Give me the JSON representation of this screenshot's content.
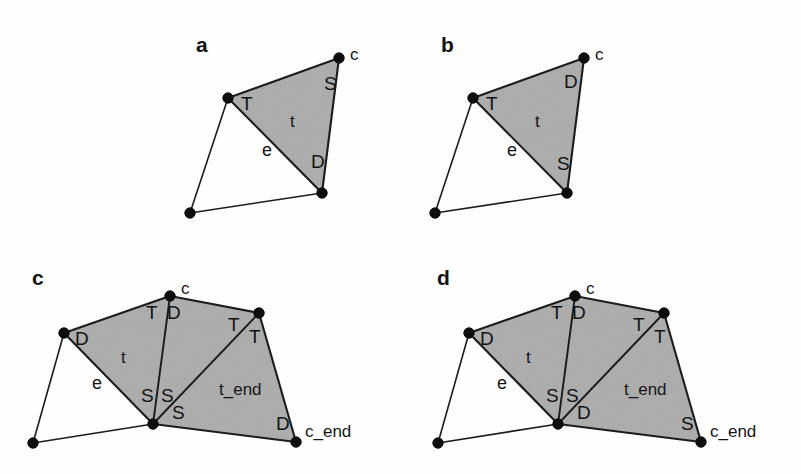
{
  "figure": {
    "background_color": "#fefefe",
    "shade_color": "#ababab",
    "line_color": "#1c1c1c",
    "node_color": "#0d0d0d",
    "panels": [
      {
        "id": "a",
        "letter": "a",
        "letter_pos": [
          196,
          52
        ],
        "shaded_polygon": [
          [
            228,
            98
          ],
          [
            339,
            58
          ],
          [
            322,
            193
          ]
        ],
        "open_polygon": [
          [
            228,
            98
          ],
          [
            190,
            213
          ],
          [
            322,
            193
          ]
        ],
        "nodes": [
          {
            "name": "node-top-right",
            "x": 339,
            "y": 58
          },
          {
            "name": "node-left",
            "x": 228,
            "y": 98
          },
          {
            "name": "node-bottom-right",
            "x": 322,
            "y": 193
          },
          {
            "name": "node-bottom-left",
            "x": 190,
            "y": 213
          }
        ],
        "labels": [
          {
            "name": "vertex-label-c",
            "text": "c",
            "x": 350,
            "y": 60,
            "cls": "vertex-label"
          },
          {
            "name": "half-edge-label-T",
            "text": "T",
            "x": 241,
            "y": 110,
            "cls": "half-edge-label"
          },
          {
            "name": "half-edge-label-S",
            "text": "S",
            "x": 324,
            "y": 90,
            "cls": "half-edge-label"
          },
          {
            "name": "face-label-t",
            "text": "t",
            "x": 290,
            "y": 127,
            "cls": "face-label"
          },
          {
            "name": "edge-label-e",
            "text": "e",
            "x": 262,
            "y": 156,
            "cls": "edge-label"
          },
          {
            "name": "half-edge-label-D",
            "text": "D",
            "x": 311,
            "y": 168,
            "cls": "half-edge-label"
          }
        ]
      },
      {
        "id": "b",
        "letter": "b",
        "letter_pos": [
          441,
          52
        ],
        "shaded_polygon": [
          [
            473,
            98
          ],
          [
            584,
            58
          ],
          [
            567,
            193
          ]
        ],
        "open_polygon": [
          [
            473,
            98
          ],
          [
            435,
            213
          ],
          [
            567,
            193
          ]
        ],
        "nodes": [
          {
            "name": "node-top-right",
            "x": 584,
            "y": 58
          },
          {
            "name": "node-left",
            "x": 473,
            "y": 98
          },
          {
            "name": "node-bottom-right",
            "x": 567,
            "y": 193
          },
          {
            "name": "node-bottom-left",
            "x": 435,
            "y": 213
          }
        ],
        "labels": [
          {
            "name": "vertex-label-c",
            "text": "c",
            "x": 595,
            "y": 60,
            "cls": "vertex-label"
          },
          {
            "name": "half-edge-label-T",
            "text": "T",
            "x": 486,
            "y": 110,
            "cls": "half-edge-label"
          },
          {
            "name": "half-edge-label-D",
            "text": "D",
            "x": 564,
            "y": 88,
            "cls": "half-edge-label"
          },
          {
            "name": "face-label-t",
            "text": "t",
            "x": 535,
            "y": 127,
            "cls": "face-label"
          },
          {
            "name": "edge-label-e",
            "text": "e",
            "x": 507,
            "y": 156,
            "cls": "edge-label"
          },
          {
            "name": "half-edge-label-S",
            "text": "S",
            "x": 557,
            "y": 170,
            "cls": "half-edge-label"
          }
        ]
      },
      {
        "id": "c",
        "letter": "c",
        "letter_pos": [
          32,
          285
        ],
        "shaded_polygon": [
          [
            64,
            333
          ],
          [
            170,
            296
          ],
          [
            259,
            313
          ],
          [
            296,
            442
          ],
          [
            153,
            424
          ]
        ],
        "open_polygon": [
          [
            64,
            333
          ],
          [
            33,
            443
          ],
          [
            153,
            424
          ]
        ],
        "inner_lines": [
          [
            [
              170,
              296
            ],
            [
              153,
              424
            ]
          ],
          [
            [
              259,
              313
            ],
            [
              153,
              424
            ]
          ]
        ],
        "nodes": [
          {
            "name": "node-c",
            "x": 170,
            "y": 296
          },
          {
            "name": "node-left",
            "x": 64,
            "y": 333
          },
          {
            "name": "node-top-right",
            "x": 259,
            "y": 313
          },
          {
            "name": "node-center-bottom",
            "x": 153,
            "y": 424
          },
          {
            "name": "node-c-end",
            "x": 296,
            "y": 442
          },
          {
            "name": "node-bottom-left",
            "x": 33,
            "y": 443
          }
        ],
        "labels": [
          {
            "name": "vertex-label-c",
            "text": "c",
            "x": 181,
            "y": 294,
            "cls": "vertex-label"
          },
          {
            "name": "half-edge-label-T1",
            "text": "T",
            "x": 146,
            "y": 319,
            "cls": "half-edge-label"
          },
          {
            "name": "half-edge-label-D1",
            "text": "D",
            "x": 167,
            "y": 319,
            "cls": "half-edge-label"
          },
          {
            "name": "half-edge-label-T2",
            "text": "T",
            "x": 228,
            "y": 331,
            "cls": "half-edge-label"
          },
          {
            "name": "half-edge-label-T3",
            "text": "T",
            "x": 249,
            "y": 343,
            "cls": "half-edge-label"
          },
          {
            "name": "half-edge-label-D2",
            "text": "D",
            "x": 75,
            "y": 345,
            "cls": "half-edge-label"
          },
          {
            "name": "face-label-t",
            "text": "t",
            "x": 121,
            "y": 363,
            "cls": "face-label"
          },
          {
            "name": "edge-label-e",
            "text": "e",
            "x": 92,
            "y": 389,
            "cls": "edge-label"
          },
          {
            "name": "half-edge-label-S1",
            "text": "S",
            "x": 141,
            "y": 402,
            "cls": "half-edge-label"
          },
          {
            "name": "half-edge-label-S2",
            "text": "S",
            "x": 161,
            "y": 402,
            "cls": "half-edge-label"
          },
          {
            "name": "half-edge-label-S3",
            "text": "S",
            "x": 172,
            "y": 419,
            "cls": "half-edge-label"
          },
          {
            "name": "face-label-t-end",
            "text": "t_end",
            "x": 219,
            "y": 395,
            "cls": "face-label"
          },
          {
            "name": "half-edge-label-D3",
            "text": "D",
            "x": 276,
            "y": 430,
            "cls": "half-edge-label"
          },
          {
            "name": "vertex-label-c-end",
            "text": "c_end",
            "x": 305,
            "y": 437,
            "cls": "vertex-label"
          }
        ]
      },
      {
        "id": "d",
        "letter": "d",
        "letter_pos": [
          437,
          285
        ],
        "shaded_polygon": [
          [
            469,
            333
          ],
          [
            575,
            296
          ],
          [
            664,
            313
          ],
          [
            701,
            442
          ],
          [
            558,
            424
          ]
        ],
        "open_polygon": [
          [
            469,
            333
          ],
          [
            438,
            443
          ],
          [
            558,
            424
          ]
        ],
        "inner_lines": [
          [
            [
              575,
              296
            ],
            [
              558,
              424
            ]
          ],
          [
            [
              664,
              313
            ],
            [
              558,
              424
            ]
          ]
        ],
        "nodes": [
          {
            "name": "node-c",
            "x": 575,
            "y": 296
          },
          {
            "name": "node-left",
            "x": 469,
            "y": 333
          },
          {
            "name": "node-top-right",
            "x": 664,
            "y": 313
          },
          {
            "name": "node-center-bottom",
            "x": 558,
            "y": 424
          },
          {
            "name": "node-c-end",
            "x": 701,
            "y": 442
          },
          {
            "name": "node-bottom-left",
            "x": 438,
            "y": 443
          }
        ],
        "labels": [
          {
            "name": "vertex-label-c",
            "text": "c",
            "x": 586,
            "y": 294,
            "cls": "vertex-label"
          },
          {
            "name": "half-edge-label-T1",
            "text": "T",
            "x": 551,
            "y": 319,
            "cls": "half-edge-label"
          },
          {
            "name": "half-edge-label-D1",
            "text": "D",
            "x": 572,
            "y": 319,
            "cls": "half-edge-label"
          },
          {
            "name": "half-edge-label-T2",
            "text": "T",
            "x": 633,
            "y": 331,
            "cls": "half-edge-label"
          },
          {
            "name": "half-edge-label-T3",
            "text": "T",
            "x": 654,
            "y": 343,
            "cls": "half-edge-label"
          },
          {
            "name": "half-edge-label-D2",
            "text": "D",
            "x": 480,
            "y": 345,
            "cls": "half-edge-label"
          },
          {
            "name": "face-label-t",
            "text": "t",
            "x": 526,
            "y": 363,
            "cls": "face-label"
          },
          {
            "name": "edge-label-e",
            "text": "e",
            "x": 497,
            "y": 389,
            "cls": "edge-label"
          },
          {
            "name": "half-edge-label-S1",
            "text": "S",
            "x": 546,
            "y": 402,
            "cls": "half-edge-label"
          },
          {
            "name": "half-edge-label-S2",
            "text": "S",
            "x": 566,
            "y": 402,
            "cls": "half-edge-label"
          },
          {
            "name": "half-edge-label-D3",
            "text": "D",
            "x": 577,
            "y": 419,
            "cls": "half-edge-label"
          },
          {
            "name": "face-label-t-end",
            "text": "t_end",
            "x": 624,
            "y": 395,
            "cls": "face-label"
          },
          {
            "name": "half-edge-label-S3",
            "text": "S",
            "x": 681,
            "y": 430,
            "cls": "half-edge-label"
          },
          {
            "name": "vertex-label-c-end",
            "text": "c_end",
            "x": 710,
            "y": 437,
            "cls": "vertex-label"
          }
        ]
      }
    ]
  }
}
